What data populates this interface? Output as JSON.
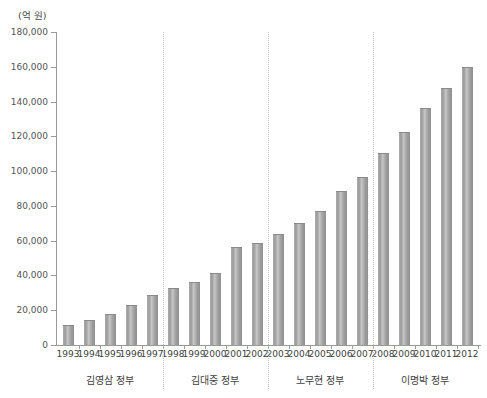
{
  "chart_data": {
    "type": "bar",
    "title": "",
    "subtitle": "",
    "xlabel": "",
    "ylabel": "",
    "unit_label": "(억 원)",
    "grid": false,
    "legend_position": "none",
    "ylim": [
      0,
      180000
    ],
    "y_ticks": [
      0,
      20000,
      40000,
      60000,
      80000,
      100000,
      120000,
      140000,
      160000,
      180000
    ],
    "y_tick_labels": [
      "0",
      "20,000",
      "40,000",
      "60,000",
      "80,000",
      "100,000",
      "120,000",
      "140,000",
      "160,000",
      "180,000"
    ],
    "categories": [
      "1993",
      "1994",
      "1995",
      "1996",
      "1997",
      "1998",
      "1999",
      "2000",
      "2001",
      "2002",
      "2003",
      "2004",
      "2005",
      "2006",
      "2007",
      "2008",
      "2009",
      "2010",
      "2011",
      "2012"
    ],
    "values": [
      11500,
      14600,
      17700,
      22800,
      28500,
      32900,
      36300,
      41200,
      56400,
      58900,
      64100,
      70300,
      77200,
      88400,
      96700,
      110300,
      122500,
      136500,
      147800,
      159800
    ],
    "series": [
      {
        "name": "예산",
        "values": [
          11500,
          14600,
          17700,
          22800,
          28500,
          32900,
          36300,
          41200,
          56400,
          58900,
          64100,
          70300,
          77200,
          88400,
          96700,
          110300,
          122500,
          136500,
          147800,
          159800
        ]
      }
    ],
    "bar_color": "#9b9b9b",
    "group_separator_color": "#bdbdbd",
    "axis_color": "#9a9a9a",
    "groups": [
      {
        "label": "김영삼 정부",
        "start": "1993",
        "end": "1997"
      },
      {
        "label": "김대중 정부",
        "start": "1998",
        "end": "2002"
      },
      {
        "label": "노무현 정부",
        "start": "2003",
        "end": "2007"
      },
      {
        "label": "이명박 정부",
        "start": "2008",
        "end": "2012"
      }
    ],
    "footnote": ""
  }
}
